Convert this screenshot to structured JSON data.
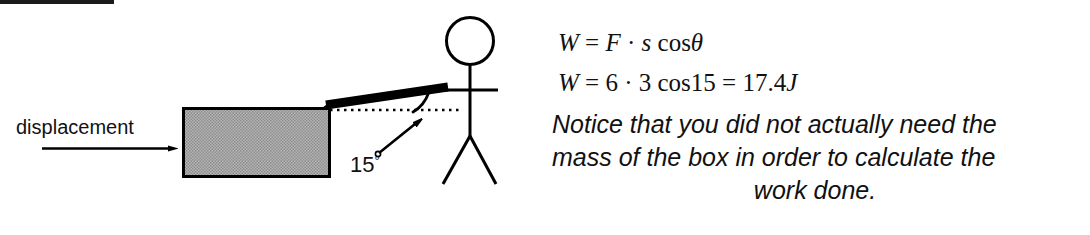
{
  "page": {
    "background_color": "#ffffff",
    "ink_color": "#111111"
  },
  "artifacts": {
    "top_bar_name": "scan-edge-bar"
  },
  "diagram": {
    "displacement_label": "displacement",
    "angle_label": "15",
    "angle_degree_symbol": "°",
    "box": {
      "name": "box-object",
      "fill_color": "#a9a9a9",
      "border_color": "#000000",
      "x": 183,
      "y": 108,
      "width": 147,
      "height": 69
    },
    "displacement_arrow": {
      "name": "displacement-arrow",
      "x1": 42,
      "y1": 148,
      "x2": 178,
      "y2": 148
    },
    "rope": {
      "name": "rope-force-vector",
      "color": "#000000",
      "x1": 325,
      "y1": 106,
      "x2": 449,
      "y2": 87,
      "thickness": 9
    },
    "dotted_reference_line": {
      "name": "horizontal-reference-line",
      "x1": 330,
      "y1": 110,
      "x2": 462,
      "y2": 110
    },
    "angle_arc": {
      "name": "angle-arc",
      "value_degrees": 15
    },
    "leader_arrow": {
      "name": "angle-leader-arrow",
      "x1": 377,
      "y1": 152,
      "x2": 424,
      "y2": 116
    },
    "person": {
      "name": "stick-figure-person",
      "head_center_x": 470,
      "head_center_y": 41,
      "head_radius": 24
    }
  },
  "equations": {
    "line1": {
      "name": "work-formula-general",
      "parts": [
        {
          "t": "W",
          "style": "var"
        },
        {
          "t": " = ",
          "style": "op"
        },
        {
          "t": "F",
          "style": "var"
        },
        {
          "t": " · ",
          "style": "op"
        },
        {
          "t": "s",
          "style": "var"
        },
        {
          "t": " cos",
          "style": "op"
        },
        {
          "t": "θ",
          "style": "var"
        }
      ],
      "plain": "W = F · s cosθ"
    },
    "line2": {
      "name": "work-formula-evaluated",
      "parts": [
        {
          "t": "W",
          "style": "var"
        },
        {
          "t": " = 6 · 3 cos15 = 17.4",
          "style": "op"
        },
        {
          "t": "J",
          "style": "var"
        }
      ],
      "plain": "W = 6 · 3 cos15 = 17.4J"
    }
  },
  "note": {
    "name": "explanatory-note",
    "line1": "Notice that you did not actually need the",
    "line2": "mass of the box in order to calculate the",
    "line3": "work done.",
    "full_text": "Notice that you did not actually need the mass of the box in order to calculate the work done."
  }
}
